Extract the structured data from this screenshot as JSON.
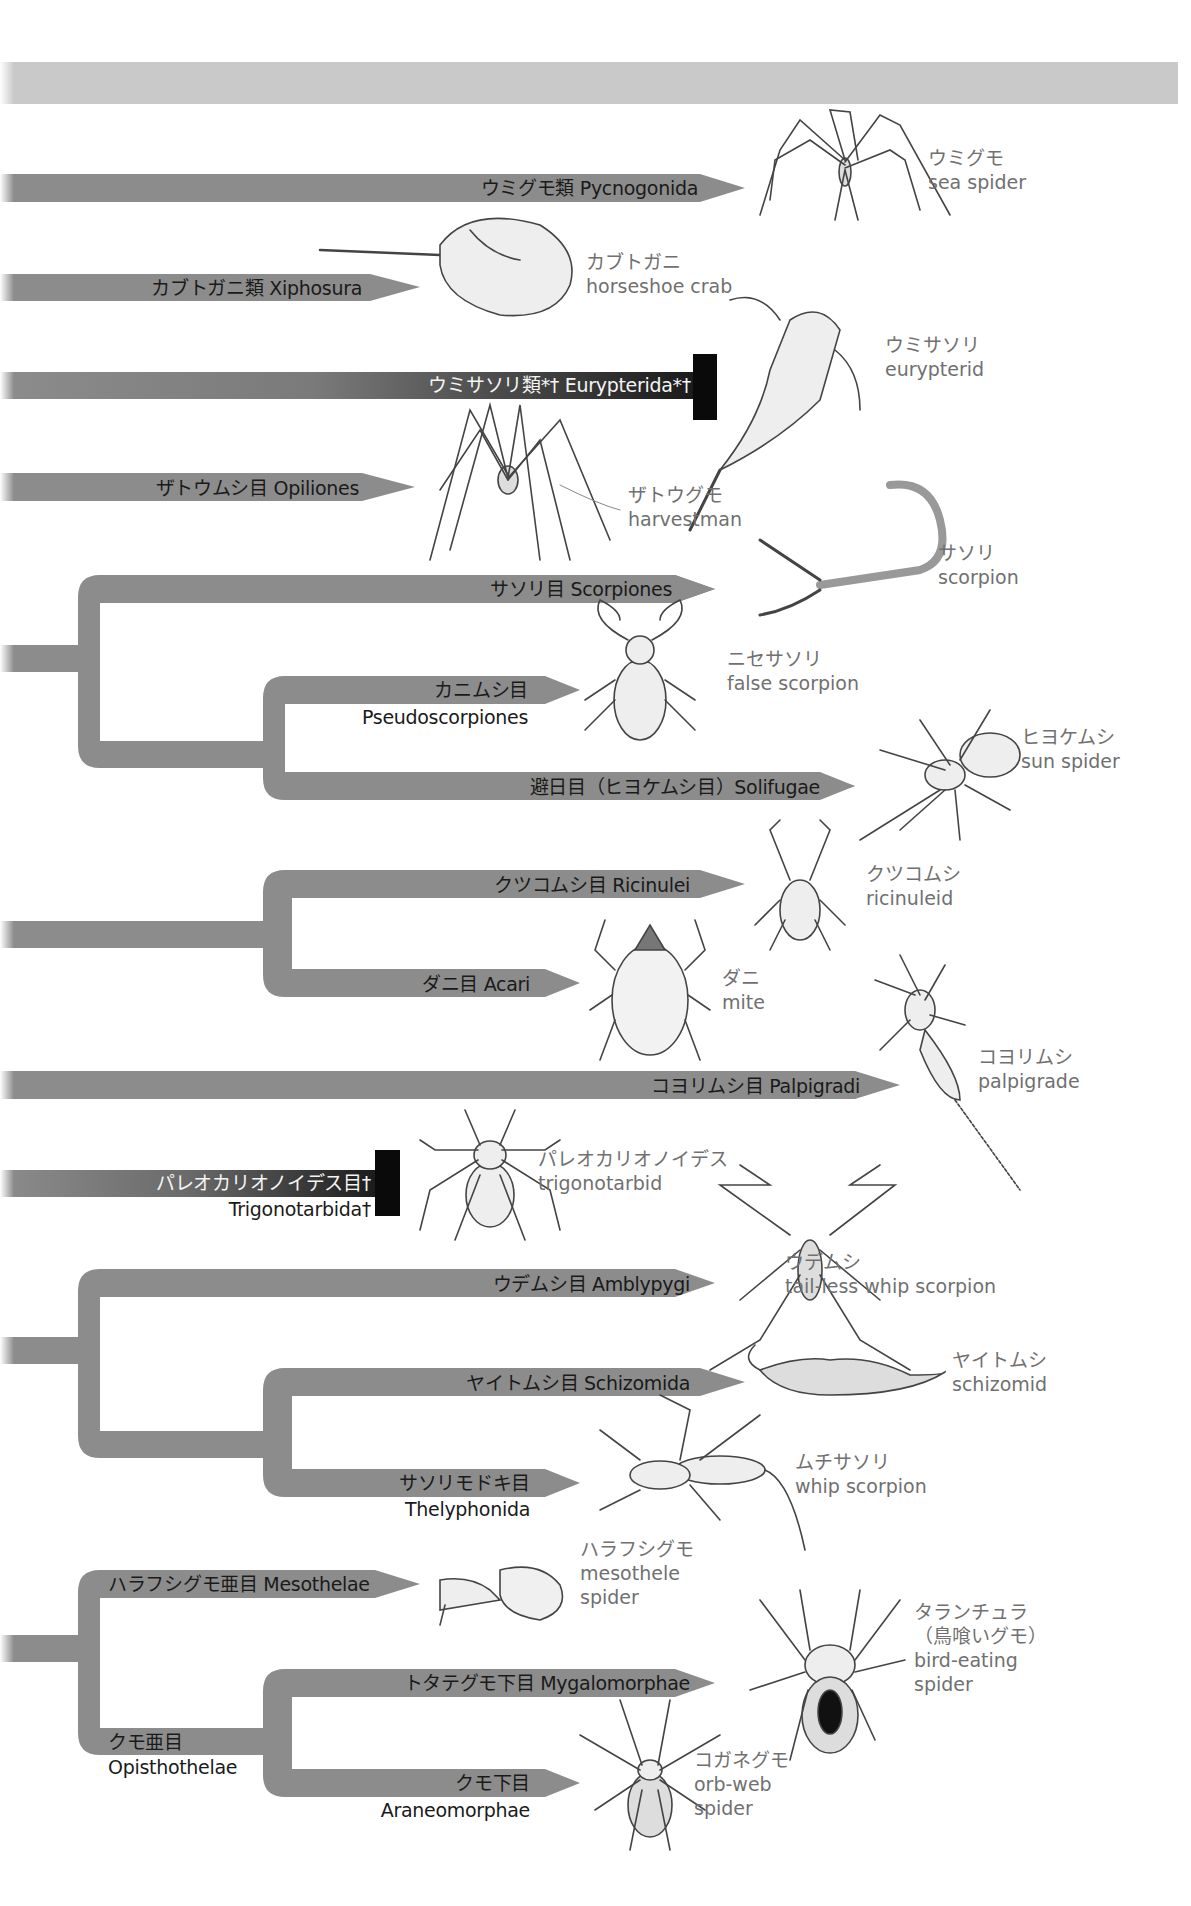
{
  "diagram": {
    "type": "phylogenetic-tree",
    "colors": {
      "branch": "#8c8c8c",
      "header_band": "#c9c9c9",
      "extinct_block": "#0a0a0a",
      "label_text": "#1a1a1a",
      "common_name_text": "#707070"
    },
    "taxa": [
      {
        "id": "pycnogonida",
        "label": "ウミグモ類 Pycnogonida",
        "common_jp": "ウミグモ",
        "common_en": "sea spider"
      },
      {
        "id": "xiphosura",
        "label": "カブトガニ類 Xiphosura",
        "common_jp": "カブトガニ",
        "common_en": "horseshoe crab"
      },
      {
        "id": "eurypterida",
        "label": "ウミサソリ類*† Eurypterida*†",
        "common_jp": "ウミサソリ",
        "common_en": "eurypterid",
        "extinct": true
      },
      {
        "id": "opiliones",
        "label": "ザトウムシ目 Opiliones",
        "common_jp": "ザトウグモ",
        "common_en": "harvestman"
      },
      {
        "id": "scorpiones",
        "label": "サソリ目 Scorpiones",
        "common_jp": "サソリ",
        "common_en": "scorpion"
      },
      {
        "id": "pseudoscorpiones",
        "label_jp": "カニムシ目",
        "label_en": "Pseudoscorpiones",
        "common_jp": "ニセサソリ",
        "common_en": "false scorpion"
      },
      {
        "id": "solifugae",
        "label": "避日目（ヒヨケムシ目）Solifugae",
        "common_jp": "ヒヨケムシ",
        "common_en": "sun spider"
      },
      {
        "id": "ricinulei",
        "label": "クツコムシ目 Ricinulei",
        "common_jp": "クツコムシ",
        "common_en": "ricinuleid"
      },
      {
        "id": "acari",
        "label": "ダニ目 Acari",
        "common_jp": "ダニ",
        "common_en": "mite"
      },
      {
        "id": "palpigradi",
        "label": "コヨリムシ目 Palpigradi",
        "common_jp": "コヨリムシ",
        "common_en": "palpigrade"
      },
      {
        "id": "trigonotarbida",
        "label_jp": "パレオカリオノイデス目†",
        "label_en": "Trigonotarbida†",
        "common_jp": "パレオカリオノイデス",
        "common_en": "trigonotarbid",
        "extinct": true
      },
      {
        "id": "amblypygi",
        "label": "ウデムシ目 Amblypygi",
        "common_jp": "ウデムシ",
        "common_en": "tail-less whip scorpion"
      },
      {
        "id": "schizomida",
        "label": "ヤイトムシ目 Schizomida",
        "common_jp": "ヤイトムシ",
        "common_en": "schizomid"
      },
      {
        "id": "thelyphonida",
        "label_jp": "サソリモドキ目",
        "label_en": "Thelyphonida",
        "common_jp": "ムチサソリ",
        "common_en": "whip scorpion"
      },
      {
        "id": "mesothelae",
        "label": "ハラフシグモ亜目 Mesothelae",
        "common_jp": "ハラフシグモ",
        "common_en1": "mesothele",
        "common_en2": "spider"
      },
      {
        "id": "opisthothelae",
        "label_jp": "クモ亜目",
        "label_en": "Opisthothelae"
      },
      {
        "id": "mygalomorphae",
        "label": "トタテグモ下目 Mygalomorphae",
        "common_jp1": "タランチュラ",
        "common_jp2": "（鳥喰いグモ）",
        "common_en1": "bird-eating",
        "common_en2": "spider"
      },
      {
        "id": "araneomorphae",
        "label_jp": "クモ下目",
        "label_en": "Araneomorphae",
        "common_jp": "コガネグモ",
        "common_en1": "orb-web",
        "common_en2": "spider"
      }
    ]
  }
}
